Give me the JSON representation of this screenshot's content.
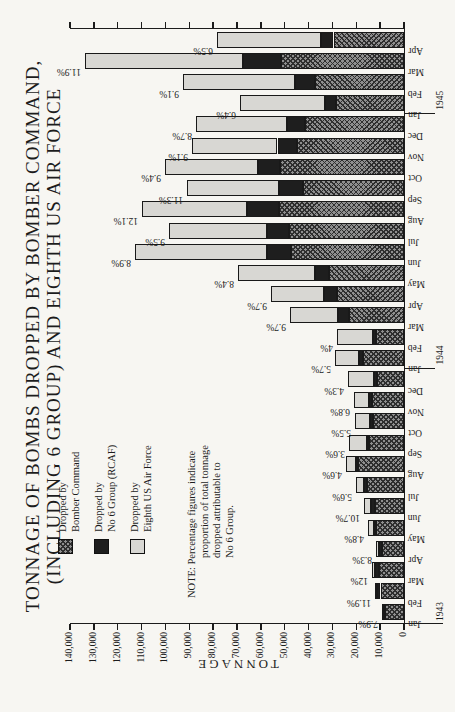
{
  "title": {
    "line1": "TONNAGE OF BOMBS DROPPED BY BOMBER COMMAND,",
    "line2": "(INCLUDING 6 GROUP) AND EIGHTH US AIR FORCE"
  },
  "y_axis": {
    "label": "TONNAGE",
    "max": 140000,
    "step": 10000,
    "tick_labels": [
      "0",
      "10,000",
      "20,000",
      "30,000",
      "40,000",
      "50,000",
      "60,000",
      "70,000",
      "80,000",
      "90,000",
      "100,000",
      "110,000",
      "120,000",
      "130,000",
      "140,000"
    ]
  },
  "legend": {
    "items": [
      {
        "swatch": "crosshatch-dark",
        "line1": "Dropped by",
        "line2": "Bomber Command"
      },
      {
        "swatch": "solid-black",
        "line1": "Dropped by",
        "line2": "No 6 Group (RCAF)"
      },
      {
        "swatch": "light-gray",
        "line1": "Dropped by",
        "line2": "Eighth US Air Force"
      }
    ]
  },
  "note": {
    "line1": "NOTE: Percentage figures indicate",
    "line2": "proportion of total tonnage",
    "line3": "dropped attributable to",
    "line4": "No 6 Group."
  },
  "years": [
    {
      "label": "1943",
      "month_index": 0
    },
    {
      "label": "1944",
      "month_index": 12
    },
    {
      "label": "1945",
      "month_index": 24
    }
  ],
  "colors": {
    "bomber_command_hatch_base": "#8f8f8f",
    "bomber_command_hatch_line": "#2e2e2e",
    "no6_group": "#1e1e1e",
    "eighth_af": "#d8d7d3",
    "outline": "#191919",
    "ink": "#1c1c1c",
    "paper": "#f7f6f2"
  },
  "chart_data": {
    "type": "bar",
    "stacked": true,
    "units": "tons",
    "ylabel": "TONNAGE",
    "ylim": [
      0,
      140000
    ],
    "tick_step": 10000,
    "grid": false,
    "orientation": "vertical stacked bars; whole chart printed rotated 90° on portrait page",
    "stacking_order_bottom_to_top": [
      "bomber_command",
      "no6_group",
      "eighth_af"
    ],
    "series_legend": [
      "Dropped by Bomber Command",
      "Dropped by No 6 Group (RCAF)",
      "Dropped by Eighth US Air Force"
    ],
    "pct_note": "percentage label above each bar = share of total tonnage dropped by No 6 Group",
    "months": [
      {
        "month": "Jan",
        "year": 1943,
        "bomber_command": 7950,
        "no6_group": 730,
        "eighth_af": 500,
        "pct_label": "7.9%"
      },
      {
        "month": "Feb",
        "year": 1943,
        "bomber_command": 9850,
        "no6_group": 1450,
        "eighth_af": 900,
        "pct_label": "11.9%"
      },
      {
        "month": "Mar",
        "year": 1943,
        "bomber_command": 10350,
        "no6_group": 1630,
        "eighth_af": 1600,
        "pct_label": "12%"
      },
      {
        "month": "Apr",
        "year": 1943,
        "bomber_command": 9400,
        "no6_group": 990,
        "eighth_af": 1510,
        "pct_label": "8.3%"
      },
      {
        "month": "May",
        "year": 1943,
        "bomber_command": 11800,
        "no6_group": 715,
        "eighth_af": 2400,
        "pct_label": "4.8%"
      },
      {
        "month": "Jun",
        "year": 1943,
        "bomber_command": 12200,
        "no6_group": 1775,
        "eighth_af": 2625,
        "pct_label": "10.7%"
      },
      {
        "month": "Jul",
        "year": 1943,
        "bomber_command": 15450,
        "no6_group": 1125,
        "eighth_af": 3525,
        "pct_label": "5.6%"
      },
      {
        "month": "Aug",
        "year": 1943,
        "bomber_command": 19100,
        "no6_group": 1120,
        "eighth_af": 4180,
        "pct_label": "4.6%"
      },
      {
        "month": "Sep",
        "year": 1943,
        "bomber_command": 14700,
        "no6_group": 825,
        "eighth_af": 7375,
        "pct_label": "3.6%"
      },
      {
        "month": "Oct",
        "year": 1943,
        "bomber_command": 13050,
        "no6_group": 1130,
        "eighth_af": 6320,
        "pct_label": "5.5%"
      },
      {
        "month": "Nov",
        "year": 1943,
        "bomber_command": 13350,
        "no6_group": 1430,
        "eighth_af": 6220,
        "pct_label": "6.8%"
      },
      {
        "month": "Dec",
        "year": 1943,
        "bomber_command": 11500,
        "no6_group": 1000,
        "eighth_af": 10800,
        "pct_label": "4.3%"
      },
      {
        "month": "Jan",
        "year": 1944,
        "bomber_command": 17050,
        "no6_group": 1650,
        "eighth_af": 10300,
        "pct_label": "5.7%"
      },
      {
        "month": "Feb",
        "year": 1944,
        "bomber_command": 11850,
        "no6_group": 1130,
        "eighth_af": 15220,
        "pct_label": "4%"
      },
      {
        "month": "Mar",
        "year": 1944,
        "bomber_command": 23050,
        "no6_group": 4630,
        "eighth_af": 20020,
        "pct_label": "9.7%"
      },
      {
        "month": "Apr",
        "year": 1944,
        "bomber_command": 28050,
        "no6_group": 5430,
        "eighth_af": 22470,
        "pct_label": "9.7%"
      },
      {
        "month": "May",
        "year": 1944,
        "bomber_command": 31400,
        "no6_group": 5850,
        "eighth_af": 32450,
        "pct_label": "8.4%"
      },
      {
        "month": "Jun",
        "year": 1944,
        "bomber_command": 47250,
        "no6_group": 10040,
        "eighth_af": 55510,
        "pct_label": "8.9%"
      },
      {
        "month": "Jul",
        "year": 1944,
        "bomber_command": 48250,
        "no6_group": 9350,
        "eighth_af": 40800,
        "pct_label": "9.5%"
      },
      {
        "month": "Aug",
        "year": 1944,
        "bomber_command": 52600,
        "no6_group": 13310,
        "eighth_af": 44090,
        "pct_label": "12.1%"
      },
      {
        "month": "Sep",
        "year": 1944,
        "bomber_command": 42300,
        "no6_group": 10280,
        "eighth_af": 38420,
        "pct_label": "11.3%"
      },
      {
        "month": "Oct",
        "year": 1944,
        "bomber_command": 51800,
        "no6_group": 9410,
        "eighth_af": 38890,
        "pct_label": "9.4%"
      },
      {
        "month": "Nov",
        "year": 1944,
        "bomber_command": 44950,
        "no6_group": 8070,
        "eighth_af": 35680,
        "pct_label": "9.1%"
      },
      {
        "month": "Dec",
        "year": 1944,
        "bomber_command": 41400,
        "no6_group": 7600,
        "eighth_af": 38300,
        "pct_label": "8.7%"
      },
      {
        "month": "Jan",
        "year": 1945,
        "bomber_command": 28600,
        "no6_group": 4400,
        "eighth_af": 35700,
        "pct_label": "6.4%"
      },
      {
        "month": "Feb",
        "year": 1945,
        "bomber_command": 37450,
        "no6_group": 8440,
        "eighth_af": 46810,
        "pct_label": "9.1%"
      },
      {
        "month": "Mar",
        "year": 1945,
        "bomber_command": 51750,
        "no6_group": 15900,
        "eighth_af": 66000,
        "pct_label": "11.9%"
      },
      {
        "month": "Apr",
        "year": 1945,
        "bomber_command": 29550,
        "no6_group": 5080,
        "eighth_af": 43570,
        "pct_label": "6.5%"
      }
    ]
  }
}
